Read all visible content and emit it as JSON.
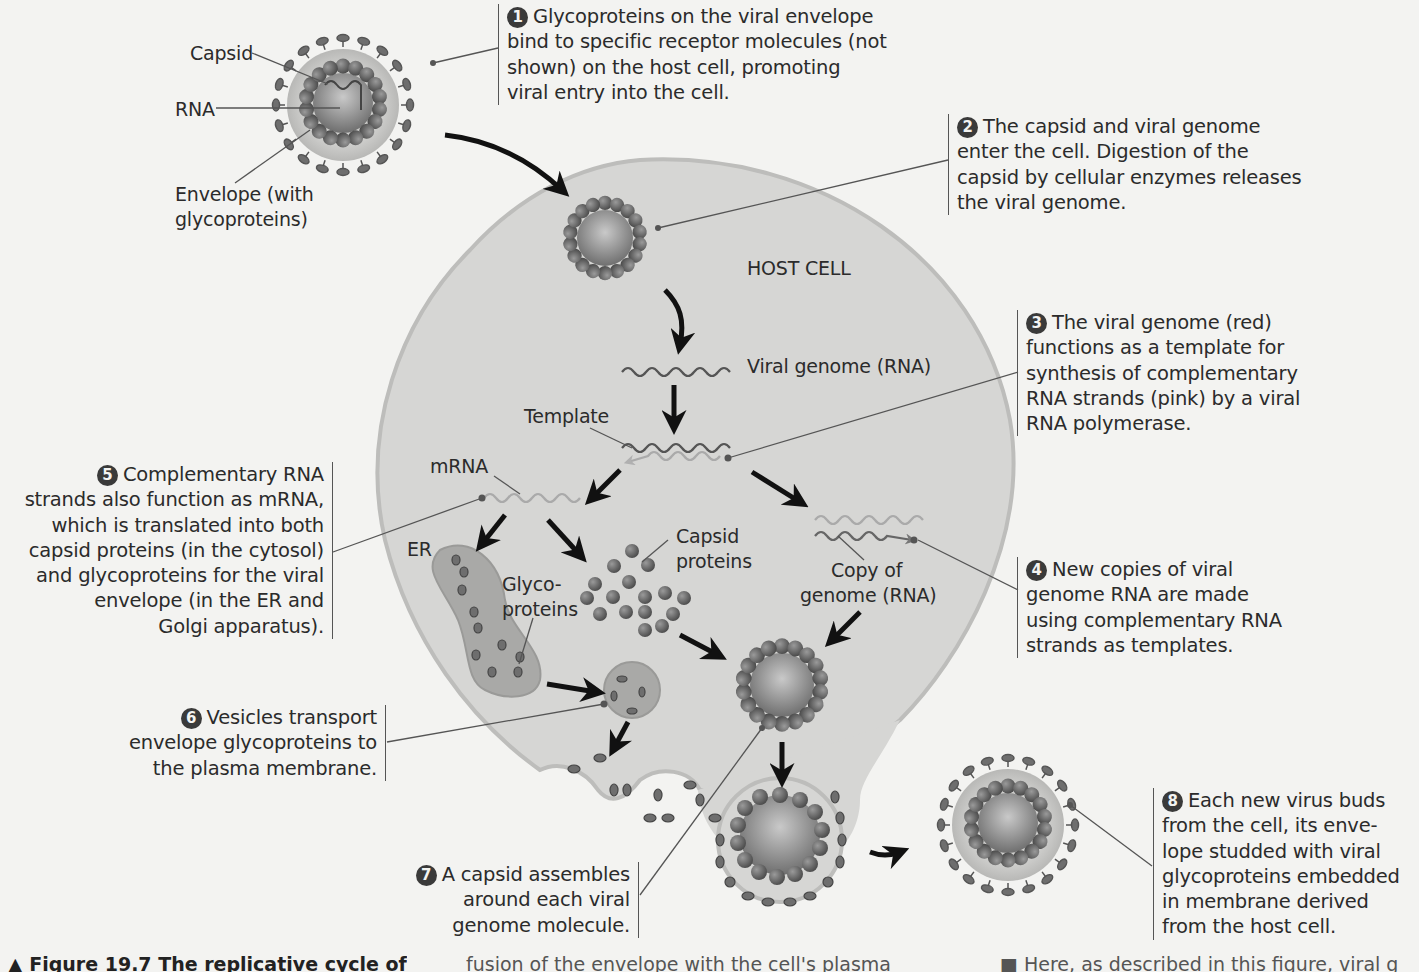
{
  "figure": {
    "caption_prefix": "▲ Figure 19.7 The replicative cycle of",
    "caption_fragment_middle": "fusion of the envelope with the cell's plasma",
    "caption_fragment_right": "■ Here, as described in this figure, viral g"
  },
  "virion_labels": {
    "capsid": "Capsid",
    "rna": "RNA",
    "envelope_line1": "Envelope (with",
    "envelope_line2": "glycoproteins)"
  },
  "cell_labels": {
    "host_cell": "HOST CELL",
    "viral_genome": "Viral genome (RNA)",
    "template": "Template",
    "mrna": "mRNA",
    "er": "ER",
    "capsid_proteins_line1": "Capsid",
    "capsid_proteins_line2": "proteins",
    "glyco_line1": "Glyco-",
    "glyco_line2": "proteins",
    "copy_line1": "Copy of",
    "copy_line2": "genome (RNA)"
  },
  "steps": [
    {
      "number": "1",
      "lines": [
        "Glycoproteins on the viral envelope",
        "bind to specific receptor molecules (not",
        "shown) on the host cell, promoting",
        "viral entry into the cell."
      ]
    },
    {
      "number": "2",
      "lines": [
        "The capsid and viral genome",
        "enter the cell. Digestion of the",
        "capsid by cellular enzymes releases",
        "the viral genome."
      ]
    },
    {
      "number": "3",
      "lines": [
        "The viral genome (red)",
        "functions as a template for",
        "synthesis of complementary",
        "RNA strands (pink) by a viral",
        "RNA polymerase."
      ]
    },
    {
      "number": "4",
      "lines": [
        "New copies of viral",
        "genome RNA are made",
        "using complementary RNA",
        "strands as templates."
      ]
    },
    {
      "number": "5",
      "lines": [
        "Complementary RNA",
        "strands also function as mRNA,",
        "which is translated into both",
        "capsid proteins (in the cytosol)",
        "and glycoproteins for the viral",
        "envelope (in the ER and",
        "Golgi apparatus)."
      ]
    },
    {
      "number": "6",
      "lines": [
        "Vesicles transport",
        "envelope glycoproteins to",
        "the plasma membrane."
      ]
    },
    {
      "number": "7",
      "lines": [
        "A capsid assembles",
        "around each viral",
        "genome molecule."
      ]
    },
    {
      "number": "8",
      "lines": [
        "Each new virus buds",
        "from the cell, its enve-",
        "lope studded with viral",
        "glycoproteins embedded",
        "in membrane derived",
        "from the host cell."
      ]
    }
  ],
  "colors": {
    "background": "#f3f3f1",
    "cell_fill": "#d6d6d4",
    "cell_edge": "#bdbdbb",
    "capsomere": "#6e6e6e",
    "genome_strand": "#555555",
    "complementary_strand": "#a9a9a9",
    "envelope": "#c8c8c6",
    "arrow": "#111111",
    "leader_line": "#555555",
    "er_fill": "#a9a9a7"
  }
}
